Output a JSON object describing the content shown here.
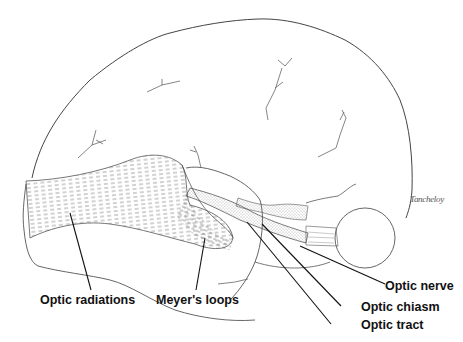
{
  "diagram": {
    "labels": [
      {
        "id": "optic-radiations",
        "text": "Optic radiations"
      },
      {
        "id": "meyers-loops",
        "text": "Meyer's loops"
      },
      {
        "id": "optic-nerve",
        "text": "Optic nerve"
      },
      {
        "id": "optic-chiasm",
        "text": "Optic chiasm"
      },
      {
        "id": "optic-tract",
        "text": "Optic tract"
      }
    ],
    "signature": "Tancheloy",
    "colors": {
      "outline": "#444444",
      "leader_line": "#111111",
      "label_text": "#111111",
      "background": "#ffffff"
    }
  }
}
